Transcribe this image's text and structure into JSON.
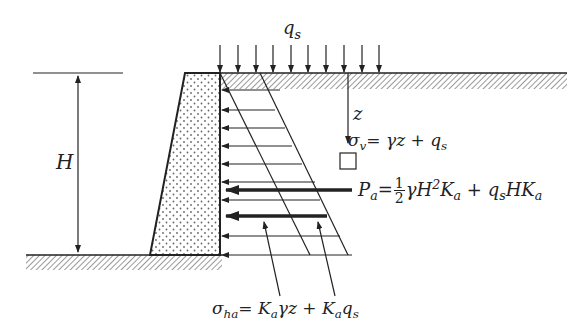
{
  "diagram": {
    "labels": {
      "surcharge": "q",
      "surcharge_sub": "s",
      "height": "H",
      "depth": "z",
      "sigma_v_lhs": "σ",
      "sigma_v_sub": "v",
      "sigma_v_rhs": "= γz + q",
      "sigma_v_rhs_sub": "s",
      "pa_lhs": "P",
      "pa_lhs_sub": "a",
      "pa_eq": "=",
      "pa_frac_num": "1",
      "pa_frac_den": "2",
      "pa_term1": "γH",
      "pa_term1_sup": "2",
      "pa_term1_k": "K",
      "pa_term1_k_sub": "a",
      "pa_plus": " + q",
      "pa_term2_sub": "s",
      "pa_term2": "HK",
      "pa_term2_sub2": "a",
      "sigma_ha_lhs": "σ",
      "sigma_ha_sub": "ha",
      "sigma_ha_eq": "= K",
      "sigma_ha_k1_sub": "a",
      "sigma_ha_mid": "γz + K",
      "sigma_ha_k2_sub": "a",
      "sigma_ha_end": "q",
      "sigma_ha_end_sub": "s"
    },
    "colors": {
      "line": "#222222",
      "hatch": "#555555",
      "dots": "#666666",
      "background": "#ffffff"
    },
    "surcharge_arrows_count": 10,
    "pressure_arrows_count": 9
  }
}
